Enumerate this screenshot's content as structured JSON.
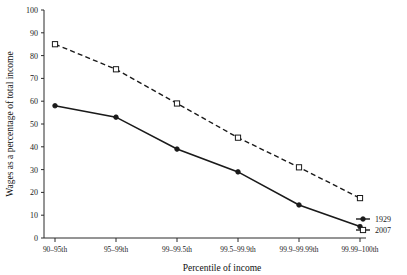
{
  "chart_data": {
    "type": "line",
    "title": "",
    "xlabel": "Percentile of income",
    "ylabel": "Wages as a percentage of total income",
    "categories": [
      "90–95th",
      "95–99th",
      "99–99.5th",
      "99.5–99.9th",
      "99.9–99.99th",
      "99.99–100th"
    ],
    "ylim": [
      0,
      100
    ],
    "yticks": [
      0,
      10,
      20,
      30,
      40,
      50,
      60,
      70,
      80,
      90,
      100
    ],
    "ytick_labels": [
      "0",
      "10",
      "20",
      "30",
      "40",
      "50",
      "60",
      "70",
      "80",
      "90",
      "100"
    ],
    "grid": false,
    "legend_position": "bottom-right",
    "series": [
      {
        "name": "1929",
        "values": [
          58,
          53,
          39,
          29,
          14.5,
          5
        ],
        "style": "solid",
        "marker": "filled-circle",
        "color": "#1a1a1a"
      },
      {
        "name": "2007",
        "values": [
          85,
          74,
          59,
          44,
          31,
          17.5
        ],
        "style": "dashed",
        "marker": "open-square",
        "color": "#1a1a1a"
      }
    ]
  },
  "legend": {
    "entries": [
      {
        "label": "1929"
      },
      {
        "label": "2007"
      }
    ]
  },
  "axes": {
    "x_title": "Percentile of income",
    "y_title": "Wages as a percentage of total income"
  }
}
